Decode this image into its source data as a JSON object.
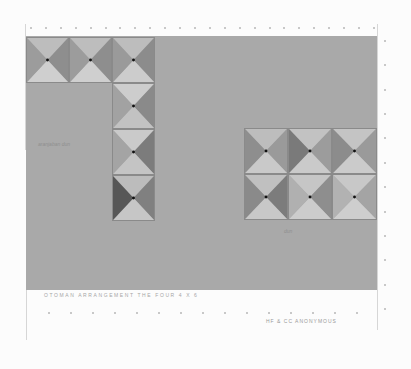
{
  "artwork": {
    "caption_title": "OTOMAN ARRANGEMENT THE FOUR 4 X 6",
    "caption_signature": "HF & CC ANONYMOUS",
    "panel_note_left": "aranjaban dun",
    "panel_note_right": "dun",
    "colors": {
      "paper": "#fcfcfc",
      "panel": "#a9a9a9",
      "tile_light": "#c8c8c8",
      "tile_mid": "#a0a0a0",
      "tile_dark": "#6f6f6f",
      "stud_center": "#111111"
    },
    "tiles_l_shape": [
      {
        "row": 0,
        "col": 0
      },
      {
        "row": 0,
        "col": 1
      },
      {
        "row": 0,
        "col": 2
      },
      {
        "row": 1,
        "col": 2
      },
      {
        "row": 2,
        "col": 2
      },
      {
        "row": 3,
        "col": 2
      }
    ],
    "tiles_grid": {
      "rows": 2,
      "cols": 3
    }
  }
}
